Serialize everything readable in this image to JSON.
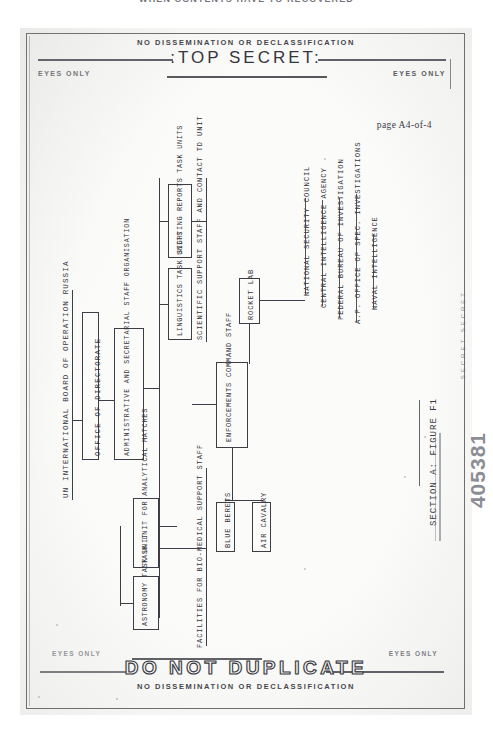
{
  "scan": {
    "top_banner_text": "WHEN CONTENTS HAVE TO RECOVERED",
    "stamp_number": "405381",
    "side_mark": "SECRET SECRET"
  },
  "header": {
    "no_dissemination": "NO DISSEMINATION OR DECLASSIFICATION",
    "classification": ":TOP SECRET:",
    "eyes_only_left": "EYES ONLY",
    "eyes_only_right": "EYES ONLY",
    "page_number": "page A4-of-4"
  },
  "footer": {
    "do_not_duplicate": "DO NOT DUPLICATE",
    "no_dissemination": "NO DISSEMINATION OR DECLASSIFICATION",
    "eyes_only_left": "EYES ONLY",
    "eyes_only_right": "EYES ONLY"
  },
  "figure": {
    "caption": "SECTION A: FIGURE F1",
    "root_label": "UN INTERNATIONAL BOARD OF OPERATION RUSSIA",
    "office_label": "OFFICE OF DIRECTORATE",
    "admin_label": "ADMINISTRATIVE AND SECRETARIAL STAFF ORGANISATION",
    "facilities_label": "FACILITIES FOR BIO-MEDICAL SUPPORT STAFF",
    "boxes": [
      {
        "label": "SIGHTING REPORTS TASK UNITS"
      },
      {
        "label": "LINGUISTICS TASK UNITS"
      },
      {
        "label": "SCIENTIFIC SUPPORT STAFF AND CONTACT TD UNIT"
      },
      {
        "label": "ROCKET LAB"
      },
      {
        "label": "ENFORCEMENTS COMMAND STAFF"
      },
      {
        "label": "BLUE BERETS"
      },
      {
        "label": "AIR CAVALRY"
      },
      {
        "label": "TASK UNIT FOR ANALYTICAL MATCHES"
      },
      {
        "label": "ASTRONOMY TASK UNIT"
      }
    ],
    "agencies": [
      {
        "label": "NATIONAL SECURITY COUNCIL"
      },
      {
        "label": "CENTRAL INTELLIGENCE AGENCY"
      },
      {
        "label": "FEDERAL BUREAU OF INVESTIGATION"
      },
      {
        "label": "A.F. OFFICE OF SPEC. INVESTIGATIONS"
      },
      {
        "label": "NAVAL INTELLIGENCE"
      }
    ]
  }
}
